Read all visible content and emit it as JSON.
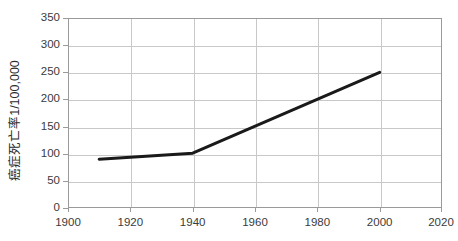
{
  "chart_data": {
    "type": "line",
    "title": "",
    "subtitle": "",
    "xlabel": "",
    "ylabel": "癌症死亡率1/100,000",
    "xlim": [
      1900,
      2020
    ],
    "ylim": [
      0,
      350
    ],
    "grid": true,
    "legend": false,
    "legend_position": "none",
    "x_ticks": [
      1900,
      1920,
      1940,
      1960,
      1980,
      2000,
      2020
    ],
    "x_tick_labels": [
      "1900",
      "1920",
      "1940",
      "1960",
      "1980",
      "2000",
      "2020"
    ],
    "y_ticks": [
      0,
      50,
      100,
      150,
      200,
      250,
      300,
      350
    ],
    "y_tick_labels": [
      "0",
      "50",
      "100",
      "150",
      "200",
      "250",
      "300",
      "350"
    ],
    "series": [
      {
        "name": "癌症死亡率",
        "color": "#1a1a1a",
        "line_width": 3,
        "x": [
          1910,
          1940,
          2000
        ],
        "values": [
          90,
          101,
          250
        ]
      }
    ],
    "annotations": []
  },
  "axis": {
    "y_title": "癌症死亡率1/100,000",
    "y_labels": [
      "350",
      "300",
      "250",
      "200",
      "150",
      "100",
      "50",
      "0"
    ],
    "x_labels": [
      "1900",
      "1920",
      "1940",
      "1960",
      "1980",
      "2000",
      "2020"
    ]
  },
  "style": {
    "background": "#ffffff",
    "frame_color": "#9a9a9a",
    "grid_color": "#c8c8c8",
    "line_color": "#1a1a1a",
    "tick_text_color": "#3a3a3a",
    "title_text_color": "#2b2b2b"
  }
}
